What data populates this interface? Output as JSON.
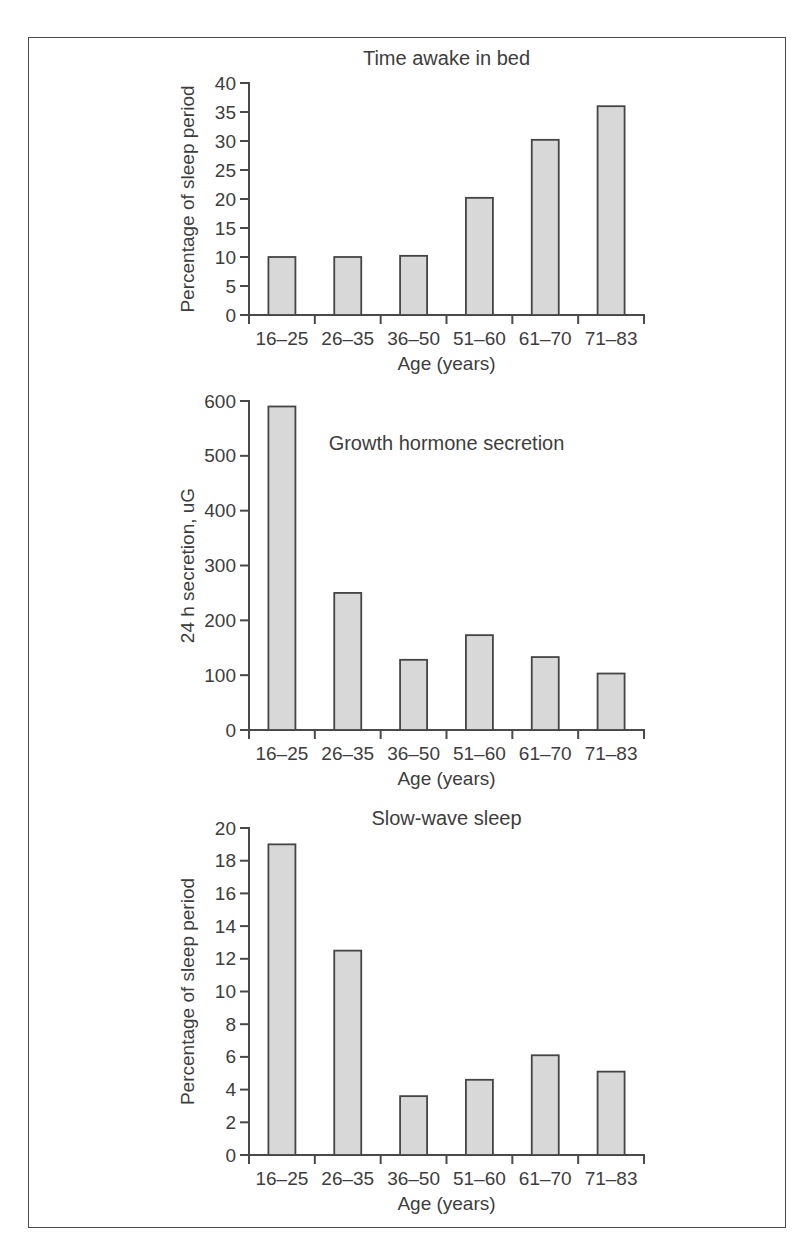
{
  "figure": {
    "background_color": "#ffffff",
    "frame_color": "#4a4a4a",
    "text_color": "#3d3d3d",
    "bar_fill_color": "#d8d8d8",
    "bar_border_color": "#454545"
  },
  "chart_data": [
    {
      "type": "bar",
      "title": "Time awake in bed",
      "title_position": "above-plot",
      "categories": [
        "16–25",
        "26–35",
        "36–50",
        "51–60",
        "61–70",
        "71–83"
      ],
      "values": [
        10,
        10,
        10.2,
        20.2,
        30.2,
        36
      ],
      "xlabel": "Age (years)",
      "ylabel": "Percentage of sleep period",
      "ylim": [
        0,
        40
      ],
      "ytick_step": 5,
      "grid": false,
      "legend": "none"
    },
    {
      "type": "bar",
      "title": "Growth hormone secretion",
      "title_position": "inside-plot",
      "categories": [
        "16–25",
        "26–35",
        "36–50",
        "51–60",
        "61–70",
        "71–83"
      ],
      "values": [
        590,
        250,
        128,
        173,
        133,
        103
      ],
      "xlabel": "Age (years)",
      "ylabel": "24 h secretion, uG",
      "ylim": [
        0,
        600
      ],
      "ytick_step": 100,
      "grid": false,
      "legend": "none"
    },
    {
      "type": "bar",
      "title": "Slow-wave sleep",
      "title_position": "above-plot",
      "categories": [
        "16–25",
        "26–35",
        "36–50",
        "51–60",
        "61–70",
        "71–83"
      ],
      "values": [
        19,
        12.5,
        3.6,
        4.6,
        6.1,
        5.1
      ],
      "xlabel": "Age (years)",
      "ylabel": "Percentage of sleep period",
      "ylim": [
        0,
        20
      ],
      "ytick_step": 2,
      "grid": false,
      "legend": "none"
    }
  ]
}
